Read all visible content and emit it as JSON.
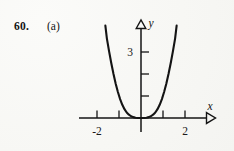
{
  "figure": {
    "problem_number": "60.",
    "part_label": "(a)",
    "background_color": "#f8f8f6",
    "ink_color": "#141414"
  },
  "chart_data": {
    "type": "line",
    "title": "",
    "subtitle": "",
    "xlabel": "x",
    "ylabel": "y",
    "function_description": "steep flat-bottomed even power curve, vertex at origin",
    "grid": false,
    "legend_position": "none",
    "xlim": [
      -2.8,
      3.0
    ],
    "ylim": [
      -0.55,
      4.3
    ],
    "x_ticks": [
      -2,
      -1,
      1,
      2
    ],
    "y_ticks": [
      1,
      2,
      3
    ],
    "x_tick_labels": [
      "-2",
      "",
      "",
      "2"
    ],
    "y_tick_labels": [
      "",
      "",
      "3"
    ],
    "x_axis_arrow": "open-triangle-right",
    "y_axis_arrow": "open-triangle-up",
    "series": [
      {
        "name": "y = x^4",
        "x": [
          -1.62,
          -1.55,
          -1.45,
          -1.35,
          -1.25,
          -1.15,
          -1.05,
          -0.95,
          -0.85,
          -0.75,
          -0.65,
          -0.55,
          -0.45,
          -0.35,
          -0.25,
          -0.15,
          0.0,
          0.15,
          0.25,
          0.35,
          0.45,
          0.55,
          0.65,
          0.75,
          0.85,
          0.95,
          1.05,
          1.15,
          1.25,
          1.35,
          1.45,
          1.55,
          1.62
        ],
        "y": [
          4.2,
          3.61,
          3.03,
          2.49,
          2.0,
          1.56,
          1.18,
          0.86,
          0.6,
          0.4,
          0.25,
          0.15,
          0.08,
          0.04,
          0.01,
          0.0,
          0.0,
          0.0,
          0.01,
          0.04,
          0.08,
          0.15,
          0.25,
          0.4,
          0.6,
          0.86,
          1.18,
          1.56,
          2.0,
          2.49,
          3.03,
          3.61,
          4.2
        ]
      }
    ]
  },
  "axes": {
    "x_axis_name": "x-axis",
    "y_axis_name": "y-axis",
    "x_label_text": "x",
    "y_label_text": "y",
    "tick_label_neg_two": "-2",
    "tick_label_pos_two": "2",
    "tick_label_three": "3"
  }
}
